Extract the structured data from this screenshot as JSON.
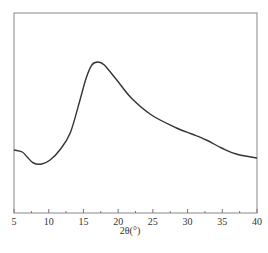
{
  "chart_data": {
    "type": "line",
    "title": "",
    "xlabel": "2θ(°)",
    "ylabel": "",
    "xlim": [
      5,
      40
    ],
    "ylim": [
      0,
      1
    ],
    "grid": false,
    "legend": null,
    "x_ticks": [
      5,
      10,
      15,
      20,
      25,
      30,
      35,
      40
    ],
    "x_tick_labels": [
      "5",
      "10",
      "15",
      "20",
      "25",
      "30",
      "35",
      "40"
    ],
    "minor_x_ticks": [
      7.5,
      12.5,
      17.5,
      22.5,
      27.5,
      32.5,
      37.5
    ],
    "y_ticks": [],
    "series": [
      {
        "name": "XRD pattern",
        "color": "#333333",
        "x": [
          5.0,
          6.2,
          6.9,
          7.8,
          9.0,
          10.2,
          11.6,
          13.1,
          14.5,
          15.4,
          16.2,
          17.1,
          18.0,
          19.8,
          21.9,
          24.8,
          28.4,
          30.6,
          32.7,
          34.9,
          37.0,
          40.0
        ],
        "y": [
          0.315,
          0.305,
          0.28,
          0.25,
          0.245,
          0.265,
          0.315,
          0.4,
          0.565,
          0.675,
          0.74,
          0.755,
          0.74,
          0.665,
          0.575,
          0.49,
          0.425,
          0.395,
          0.365,
          0.325,
          0.295,
          0.275
        ]
      }
    ],
    "annotations": []
  },
  "plot": {
    "frame": {
      "left": 14,
      "right": 257,
      "top": 13,
      "bottom": 213
    },
    "line_color": "#333333",
    "frame_color": "#888888"
  },
  "caption_text": ""
}
